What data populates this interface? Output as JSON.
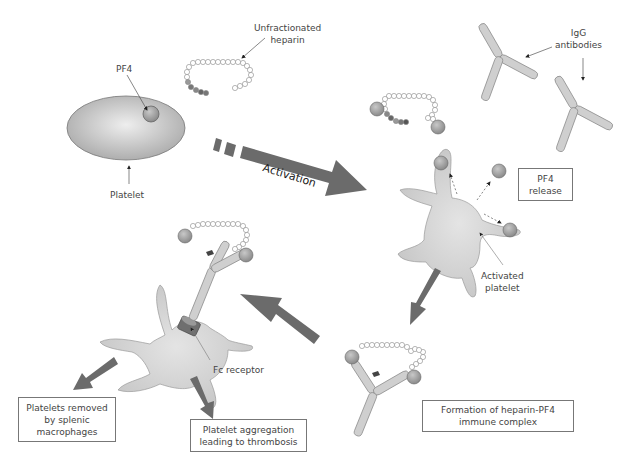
{
  "diagram": {
    "labels": {
      "pf4": "PF4",
      "platelet": "Platelet",
      "unfractionated_heparin_line1": "Unfractionated",
      "unfractionated_heparin_line2": "heparin",
      "igg_line1": "IgG",
      "igg_line2": "antibodies",
      "activation": "Activation",
      "activated_platelet_line1": "Activated",
      "activated_platelet_line2": "platelet",
      "fc_receptor": "Fc  receptor"
    },
    "boxes": {
      "pf4_release": [
        "PF4",
        "release"
      ],
      "immune_complex": [
        "Formation of heparin-PF4",
        "immune complex"
      ],
      "splenic_removal": [
        "Platelets removed",
        "by splenic",
        "macrophages"
      ],
      "aggregation": [
        "Platelet aggregation",
        "leading to thrombosis"
      ]
    },
    "colors": {
      "arrow": "#6b6b6b",
      "platelet_fill": "#c8c8c8",
      "sphere": "#9a9a9a",
      "antibody": "#cfcfcf",
      "outline": "#888888",
      "text": "#444444"
    }
  }
}
